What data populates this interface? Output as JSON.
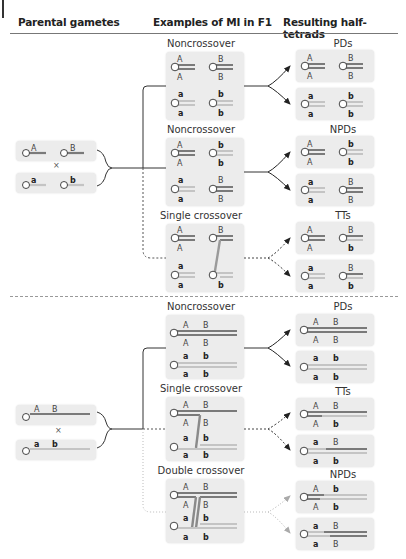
{
  "headers": {
    "parental": "Parental gametes",
    "examples": "Examples of MI in F1",
    "resulting": "Resulting half-tetrads"
  },
  "colors": {
    "dark_chromatid": "#7a7a7a",
    "light_chromatid": "#c4c4c4",
    "box_bg": "#ececec",
    "arrow": "#222222",
    "faded_arrow": "#aaaaaa"
  },
  "top_panel": {
    "parental": {
      "gamete1": [
        "A",
        "B"
      ],
      "gamete2": [
        "a",
        "b"
      ],
      "cross_symbol": "×"
    },
    "examples": [
      {
        "title": "Noncrossover",
        "type": "noncrossover"
      },
      {
        "title": "Noncrossover",
        "type": "noncrossover"
      },
      {
        "title": "Single crossover",
        "type": "single-crossover"
      }
    ],
    "results": [
      {
        "title": "PDs",
        "boxes": [
          {
            "labels_top": [
              "A",
              "B"
            ],
            "labels_bottom": [
              "A",
              "B"
            ]
          },
          {
            "labels_top": [
              "a",
              "b"
            ],
            "labels_bottom": [
              "a",
              "b"
            ]
          }
        ]
      },
      {
        "title": "NPDs",
        "boxes": [
          {
            "labels_top": [
              "A",
              "b"
            ],
            "labels_bottom": [
              "A",
              "b"
            ]
          },
          {
            "labels_top": [
              "a",
              "B"
            ],
            "labels_bottom": [
              "a",
              "B"
            ]
          }
        ]
      },
      {
        "title": "TTs",
        "boxes": [
          {
            "labels_top": [
              "A",
              "B"
            ],
            "labels_bottom": [
              "A",
              "b"
            ]
          },
          {
            "labels_top": [
              "a",
              "B"
            ],
            "labels_bottom": [
              "a",
              "b"
            ]
          }
        ]
      }
    ]
  },
  "bottom_panel": {
    "parental": {
      "gamete1": [
        "A",
        "B"
      ],
      "gamete2": [
        "a",
        "b"
      ],
      "cross_symbol": "×"
    },
    "examples": [
      {
        "title": "Noncrossover",
        "type": "noncrossover"
      },
      {
        "title": "Single crossover",
        "type": "single-crossover"
      },
      {
        "title": "Double crossover",
        "type": "double-crossover"
      }
    ],
    "results": [
      {
        "title": "PDs",
        "boxes": [
          {
            "labels_top": [
              "A",
              "B"
            ],
            "labels_bottom": [
              "A",
              "B"
            ]
          },
          {
            "labels_top": [
              "a",
              "b"
            ],
            "labels_bottom": [
              "a",
              "b"
            ]
          }
        ]
      },
      {
        "title": "TTs",
        "boxes": [
          {
            "labels_top": [
              "A",
              "B"
            ],
            "labels_bottom": [
              "A",
              "b"
            ]
          },
          {
            "labels_top": [
              "a",
              "B"
            ],
            "labels_bottom": [
              "a",
              "b"
            ]
          }
        ]
      },
      {
        "title": "NPDs",
        "boxes": [
          {
            "labels_top": [
              "A",
              "b"
            ],
            "labels_bottom": [
              "A",
              "b"
            ]
          },
          {
            "labels_top": [
              "a",
              "B"
            ],
            "labels_bottom": [
              "a",
              "B"
            ]
          }
        ]
      }
    ]
  }
}
